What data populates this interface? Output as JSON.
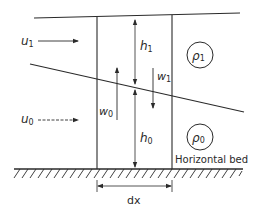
{
  "diagram": {
    "labels": {
      "u1": "u",
      "u1_sub": "1",
      "u0": "u",
      "u0_sub": "0",
      "h1": "h",
      "h1_sub": "1",
      "h0": "h",
      "h0_sub": "0",
      "w1": "w",
      "w1_sub": "1",
      "w0": "w",
      "w0_sub": "0",
      "rho1": "ρ",
      "rho1_sub": "1",
      "rho0": "ρ",
      "rho0_sub": "0",
      "bed": "Horizontal bed",
      "dx": "dx"
    },
    "colors": {
      "line": "#2a2a2a",
      "background": "#ffffff"
    }
  }
}
